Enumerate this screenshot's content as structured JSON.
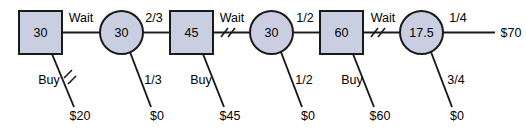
{
  "diagram": {
    "type": "decision-tree",
    "colors": {
      "node_fill": "#c9cfe0",
      "node_stroke": "#1a1a1a",
      "edge_stroke": "#1a1a1a",
      "text": "#000000",
      "background": "#ffffff"
    },
    "nodes": [
      {
        "id": "d1",
        "shape": "square",
        "value": "30",
        "cx": 40.5,
        "cy": 32.5
      },
      {
        "id": "c1",
        "shape": "circle",
        "value": "30",
        "cx": 121.5,
        "cy": 32.5
      },
      {
        "id": "d2",
        "shape": "square",
        "value": "45",
        "cx": 191.5,
        "cy": 32.5
      },
      {
        "id": "c2",
        "shape": "circle",
        "value": "30",
        "cx": 271.5,
        "cy": 32.5
      },
      {
        "id": "d3",
        "shape": "square",
        "value": "60",
        "cx": 341.5,
        "cy": 32.5
      },
      {
        "id": "c3",
        "shape": "circle",
        "value": "17.5",
        "cx": 421.5,
        "cy": 32.5
      }
    ],
    "edge_labels_top": [
      {
        "text": "Wait",
        "x": 81,
        "y": 18
      },
      {
        "text": "2/3",
        "x": 154,
        "y": 18
      },
      {
        "text": "Wait",
        "x": 232,
        "y": 18
      },
      {
        "text": "1/2",
        "x": 305,
        "y": 18
      },
      {
        "text": "Wait",
        "x": 383,
        "y": 18
      },
      {
        "text": "1/4",
        "x": 458,
        "y": 18
      }
    ],
    "edge_labels_lower": [
      {
        "text": "Buy",
        "x": 49,
        "y": 80
      },
      {
        "text": "1/3",
        "x": 153,
        "y": 80
      },
      {
        "text": "Buy",
        "x": 201,
        "y": 80
      },
      {
        "text": "1/2",
        "x": 304,
        "y": 80
      },
      {
        "text": "Buy",
        "x": 352,
        "y": 80
      },
      {
        "text": "3/4",
        "x": 456,
        "y": 80
      }
    ],
    "terminals": [
      {
        "text": "$20",
        "x": 80,
        "y": 116
      },
      {
        "text": "$0",
        "x": 157,
        "y": 116
      },
      {
        "text": "$45",
        "x": 230,
        "y": 116
      },
      {
        "text": "$0",
        "x": 308,
        "y": 116
      },
      {
        "text": "$60",
        "x": 380,
        "y": 116
      },
      {
        "text": "$0",
        "x": 457,
        "y": 116
      },
      {
        "text": "$70",
        "x": 511,
        "y": 32.5
      }
    ]
  }
}
